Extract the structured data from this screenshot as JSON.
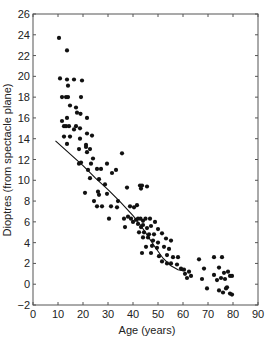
{
  "chart_data": {
    "type": "scatter",
    "title": "",
    "xlabel": "Age (years)",
    "ylabel": "Dioptres (from spectacle plane)",
    "xlim": [
      0,
      90
    ],
    "ylim": [
      -2,
      26
    ],
    "xticks": [
      0,
      10,
      20,
      30,
      40,
      50,
      60,
      70,
      80,
      90
    ],
    "yticks": [
      -2,
      0,
      2,
      4,
      6,
      8,
      10,
      12,
      14,
      16,
      18,
      20,
      22,
      24,
      26
    ],
    "grid": false,
    "legend": null,
    "series": [
      {
        "name": "Observations",
        "kind": "scatter",
        "color": "#111111",
        "points": [
          [
            10.4,
            23.7
          ],
          [
            13.6,
            22.5
          ],
          [
            10.8,
            19.8
          ],
          [
            13.6,
            19.7
          ],
          [
            16.4,
            19.7
          ],
          [
            14.0,
            19.1
          ],
          [
            19.6,
            19.6
          ],
          [
            11.6,
            18.0
          ],
          [
            13.2,
            18.0
          ],
          [
            14.0,
            18.0
          ],
          [
            19.2,
            18.0
          ],
          [
            14.8,
            17.2
          ],
          [
            17.2,
            17.0
          ],
          [
            17.6,
            16.5
          ],
          [
            19.0,
            16.4
          ],
          [
            11.6,
            15.7
          ],
          [
            13.6,
            16.0
          ],
          [
            21.6,
            16.0
          ],
          [
            12.4,
            15.2
          ],
          [
            13.2,
            15.2
          ],
          [
            14.4,
            15.2
          ],
          [
            16.4,
            14.9
          ],
          [
            17.2,
            15.2
          ],
          [
            18.8,
            15.0
          ],
          [
            12.4,
            14.2
          ],
          [
            14.8,
            14.2
          ],
          [
            18.8,
            14.0
          ],
          [
            21.6,
            14.5
          ],
          [
            23.6,
            14.3
          ],
          [
            13.6,
            13.5
          ],
          [
            21.2,
            13.4
          ],
          [
            21.2,
            13.2
          ],
          [
            18.4,
            13.0
          ],
          [
            22.8,
            13.0
          ],
          [
            21.6,
            12.7
          ],
          [
            24.0,
            12.1
          ],
          [
            35.6,
            12.6
          ],
          [
            19.2,
            11.7
          ],
          [
            18.4,
            11.6
          ],
          [
            23.2,
            11.6
          ],
          [
            29.6,
            11.6
          ],
          [
            25.6,
            11.1
          ],
          [
            27.2,
            11.1
          ],
          [
            22.0,
            11.0
          ],
          [
            33.2,
            11.0
          ],
          [
            31.6,
            10.7
          ],
          [
            22.8,
            10.2
          ],
          [
            26.4,
            10.1
          ],
          [
            28.8,
            9.6
          ],
          [
            37.6,
            9.3
          ],
          [
            42.8,
            9.5
          ],
          [
            43.6,
            9.5
          ],
          [
            45.6,
            9.4
          ],
          [
            43.2,
            9.2
          ],
          [
            20.8,
            8.8
          ],
          [
            26.0,
            8.9
          ],
          [
            26.4,
            8.6
          ],
          [
            29.6,
            8.7
          ],
          [
            24.4,
            8.0
          ],
          [
            34.0,
            8.0
          ],
          [
            25.6,
            7.5
          ],
          [
            27.6,
            7.5
          ],
          [
            31.2,
            7.5
          ],
          [
            33.6,
            7.4
          ],
          [
            38.8,
            7.5
          ],
          [
            40.4,
            7.4
          ],
          [
            41.6,
            7.6
          ],
          [
            30.4,
            6.3
          ],
          [
            36.4,
            6.3
          ],
          [
            38.0,
            6.5
          ],
          [
            39.2,
            6.3
          ],
          [
            40.0,
            6.0
          ],
          [
            41.2,
            6.2
          ],
          [
            42.0,
            6.3
          ],
          [
            43.0,
            6.3
          ],
          [
            44.0,
            6.1
          ],
          [
            45.0,
            6.3
          ],
          [
            46.8,
            6.3
          ],
          [
            48.8,
            6.0
          ],
          [
            36.8,
            5.5
          ],
          [
            42.0,
            5.8
          ],
          [
            43.2,
            5.5
          ],
          [
            44.0,
            5.7
          ],
          [
            45.6,
            5.4
          ],
          [
            47.2,
            5.6
          ],
          [
            50.0,
            5.3
          ],
          [
            42.4,
            5.0
          ],
          [
            44.4,
            5.0
          ],
          [
            46.4,
            4.8
          ],
          [
            48.4,
            4.8
          ],
          [
            51.6,
            4.9
          ],
          [
            44.0,
            4.5
          ],
          [
            46.0,
            4.5
          ],
          [
            48.0,
            4.2
          ],
          [
            50.0,
            4.0
          ],
          [
            53.2,
            4.4
          ],
          [
            55.2,
            4.2
          ],
          [
            45.2,
            3.6
          ],
          [
            47.6,
            3.7
          ],
          [
            49.6,
            3.5
          ],
          [
            52.4,
            3.6
          ],
          [
            54.4,
            3.4
          ],
          [
            43.6,
            3.0
          ],
          [
            47.2,
            3.0
          ],
          [
            50.4,
            2.7
          ],
          [
            53.6,
            2.8
          ],
          [
            56.0,
            2.6
          ],
          [
            58.0,
            2.6
          ],
          [
            51.6,
            2.2
          ],
          [
            53.6,
            2.0
          ],
          [
            55.2,
            2.0
          ],
          [
            57.6,
            1.9
          ],
          [
            59.2,
            1.5
          ],
          [
            60.8,
            1.0
          ],
          [
            62.4,
            1.2
          ],
          [
            63.2,
            0.8
          ],
          [
            61.6,
            0.6
          ],
          [
            60.4,
            1.4
          ],
          [
            66.4,
            2.4
          ],
          [
            68.4,
            1.5
          ],
          [
            72.4,
            2.6
          ],
          [
            75.6,
            2.6
          ],
          [
            67.6,
            0.5
          ],
          [
            69.6,
            -0.4
          ],
          [
            72.4,
            0.9
          ],
          [
            74.4,
            1.6
          ],
          [
            76.4,
            1.1
          ],
          [
            76.8,
            0.5
          ],
          [
            78.0,
            1.2
          ],
          [
            78.8,
            0.8
          ],
          [
            79.6,
            0.8
          ],
          [
            73.6,
            0.4
          ],
          [
            75.2,
            0.6
          ],
          [
            77.6,
            -0.3
          ],
          [
            74.4,
            -0.6
          ],
          [
            76.0,
            -0.8
          ],
          [
            77.2,
            -0.4
          ],
          [
            78.8,
            -0.9
          ],
          [
            79.6,
            -1.0
          ]
        ]
      },
      {
        "name": "Fitted curve",
        "kind": "line",
        "color": "#111111",
        "points": [
          [
            9,
            13.8
          ],
          [
            15,
            12.5
          ],
          [
            20,
            11.4
          ],
          [
            25,
            10.2
          ],
          [
            30,
            9.1
          ],
          [
            35,
            7.9
          ],
          [
            40,
            6.6
          ],
          [
            43,
            5.7
          ],
          [
            46,
            4.6
          ],
          [
            49,
            3.5
          ],
          [
            52,
            2.5
          ],
          [
            55,
            1.8
          ],
          [
            58,
            1.4
          ],
          [
            60,
            1.3
          ]
        ]
      }
    ]
  }
}
